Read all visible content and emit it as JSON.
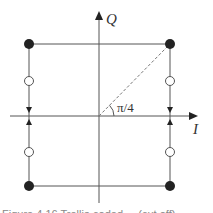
{
  "diagram": {
    "type": "signal-constellation",
    "axes": {
      "horizontal_label": "I",
      "vertical_label": "Q"
    },
    "angle_label": "π/4",
    "points": {
      "filled": [
        [
          -1,
          1
        ],
        [
          1,
          1
        ],
        [
          -1,
          -1
        ],
        [
          1,
          -1
        ]
      ],
      "hollow": [
        [
          -1,
          0.5
        ],
        [
          1,
          0.5
        ],
        [
          -1,
          -0.5
        ],
        [
          1,
          -0.5
        ]
      ]
    },
    "transition_arrows": "vertical edges point toward the I axis from both sides",
    "caption": "Figure 4.16  Trellis-coded ... (cut off)"
  },
  "colors": {
    "line": "#555555",
    "dot": "#222222",
    "dash": "#777777"
  }
}
